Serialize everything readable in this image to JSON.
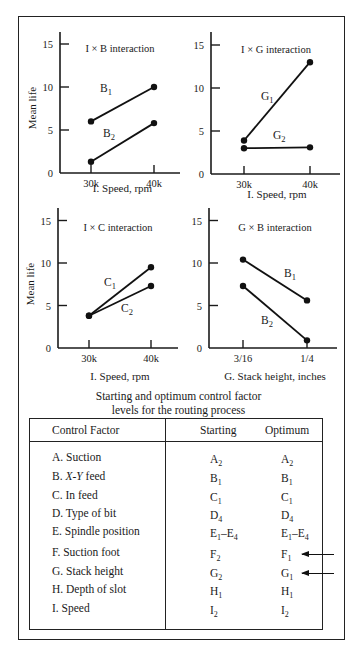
{
  "chart_data": [
    {
      "type": "line",
      "title": "I × B interaction",
      "xlabel": "I. Speed, rpm",
      "ylabel": "Mean life",
      "categories": [
        "30k",
        "40k"
      ],
      "ylim": [
        0,
        15
      ],
      "yticks": [
        0,
        5,
        10,
        15
      ],
      "grid": false,
      "series": [
        {
          "name": "B1",
          "label_main": "B",
          "label_sub": "1",
          "values": [
            6.0,
            10.0
          ]
        },
        {
          "name": "B2",
          "label_main": "B",
          "label_sub": "2",
          "values": [
            1.3,
            5.8
          ]
        }
      ]
    },
    {
      "type": "line",
      "title": "I × G interaction",
      "xlabel": "I. Speed, rpm",
      "ylabel": "",
      "categories": [
        "30k",
        "40k"
      ],
      "ylim": [
        0,
        15
      ],
      "yticks": [
        0,
        5,
        10,
        15
      ],
      "grid": false,
      "series": [
        {
          "name": "G1",
          "label_main": "G",
          "label_sub": "1",
          "values": [
            3.9,
            13.0
          ]
        },
        {
          "name": "G2",
          "label_main": "G",
          "label_sub": "2",
          "values": [
            3.0,
            3.1
          ]
        }
      ]
    },
    {
      "type": "line",
      "title": "I × C interaction",
      "xlabel": "I. Speed, rpm",
      "ylabel": "Mean life",
      "categories": [
        "30k",
        "40k"
      ],
      "ylim": [
        0,
        15
      ],
      "yticks": [
        0,
        5,
        10,
        15
      ],
      "grid": false,
      "series": [
        {
          "name": "C1",
          "label_main": "C",
          "label_sub": "1",
          "values": [
            3.8,
            7.3
          ]
        },
        {
          "name": "C2",
          "label_main": "C",
          "label_sub": "2",
          "values": [
            3.8,
            9.5
          ]
        }
      ]
    },
    {
      "type": "line",
      "title": "G × B interaction",
      "xlabel": "G. Stack height, inches",
      "ylabel": "",
      "categories": [
        "3/16",
        "1/4"
      ],
      "ylim": [
        0,
        15
      ],
      "yticks": [
        0,
        5,
        10,
        15
      ],
      "grid": false,
      "series": [
        {
          "name": "B1",
          "label_main": "B",
          "label_sub": "1",
          "values": [
            10.4,
            5.6
          ]
        },
        {
          "name": "B2",
          "label_main": "B",
          "label_sub": "2",
          "values": [
            7.3,
            0.9
          ]
        }
      ]
    }
  ],
  "caption": {
    "line1": "Starting and optimum control factor",
    "line2": "levels for the routing process"
  },
  "table": {
    "headers": [
      "Control Factor",
      "Starting",
      "Optimum"
    ],
    "rows": [
      {
        "factor": "A. Suction",
        "start": {
          "m": "A",
          "s": "2"
        },
        "opt": {
          "m": "A",
          "s": "2"
        },
        "changed": false
      },
      {
        "factor_pre": "B. ",
        "factor_it": "X-Y",
        "factor_post": " feed",
        "start": {
          "m": "B",
          "s": "1"
        },
        "opt": {
          "m": "B",
          "s": "1"
        },
        "changed": false
      },
      {
        "factor": "C. In feed",
        "start": {
          "m": "C",
          "s": "1"
        },
        "opt": {
          "m": "C",
          "s": "1"
        },
        "changed": false
      },
      {
        "factor": "D. Type of bit",
        "start": {
          "m": "D",
          "s": "4"
        },
        "opt": {
          "m": "D",
          "s": "4"
        },
        "changed": false
      },
      {
        "factor": "E. Spindle position",
        "start": {
          "m": "E",
          "s": "1",
          "m2": "–E",
          "s2": "4"
        },
        "opt": {
          "m": "E",
          "s": "1",
          "m2": "–E",
          "s2": "4"
        },
        "changed": false
      },
      {
        "factor": "F. Suction foot",
        "start": {
          "m": "F",
          "s": "2"
        },
        "opt": {
          "m": "F",
          "s": "1"
        },
        "changed": true
      },
      {
        "factor": "G. Stack height",
        "start": {
          "m": "G",
          "s": "2"
        },
        "opt": {
          "m": "G",
          "s": "1"
        },
        "changed": true
      },
      {
        "factor": "H. Depth of slot",
        "start": {
          "m": "H",
          "s": "1"
        },
        "opt": {
          "m": "H",
          "s": "1"
        },
        "changed": false
      },
      {
        "factor": "I. Speed",
        "start": {
          "m": "I",
          "s": "2"
        },
        "opt": {
          "m": "I",
          "s": "2"
        },
        "changed": false
      }
    ]
  }
}
